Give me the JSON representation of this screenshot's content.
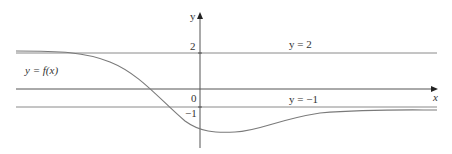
{
  "axes": {
    "x_label": "x",
    "y_label": "y",
    "tick_2": "2",
    "tick_0": "0",
    "tick_neg1": "−1"
  },
  "asymptotes": {
    "upper_label": "y = 2",
    "lower_label": "y = −1"
  },
  "curve": {
    "label": "y = f(x)"
  },
  "colors": {
    "line": "#7a7a7a",
    "axis": "#333333"
  }
}
